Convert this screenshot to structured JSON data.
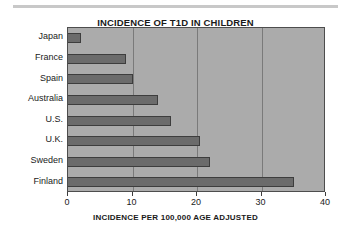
{
  "chart_data": {
    "type": "bar",
    "orientation": "horizontal",
    "title": "INCIDENCE OF T1D IN CHILDREN",
    "xlabel": "INCIDENCE PER 100,000 AGE ADJUSTED",
    "ylabel": "",
    "categories": [
      "Japan",
      "France",
      "Spain",
      "Australia",
      "U.S.",
      "U.K.",
      "Sweden",
      "Finland"
    ],
    "values": [
      2,
      9,
      10,
      14,
      16,
      20.5,
      22,
      35
    ],
    "xlim": [
      0,
      40
    ],
    "xticks": [
      0,
      10,
      20,
      30,
      40
    ],
    "xtick_labels": [
      "0",
      "10",
      "20",
      "30",
      "40"
    ],
    "gridlines": [
      10,
      20,
      30
    ],
    "grid": true,
    "legend": null,
    "colors": {
      "bar_fill": "#6b6b6b",
      "bar_border": "#3d3d3d",
      "plot_background": "#ababab",
      "plot_border": "#4d4d4d",
      "gridline": "#7a7a7a",
      "page_background": "#ffffff",
      "text": "#1a1a1a",
      "top_rule": "#c8c8c8"
    }
  }
}
